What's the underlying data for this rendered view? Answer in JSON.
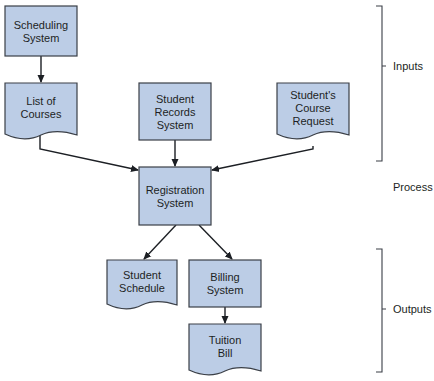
{
  "diagram": {
    "type": "system-flowchart",
    "colors": {
      "box_fill": "#bccde6",
      "box_stroke": "#3a3f47",
      "text": "#1c1f24"
    },
    "nodes": [
      {
        "id": "scheduling",
        "shape": "process",
        "lines": [
          "Scheduling",
          "System"
        ]
      },
      {
        "id": "courses",
        "shape": "document",
        "lines": [
          "List of",
          "Courses"
        ]
      },
      {
        "id": "records",
        "shape": "process",
        "lines": [
          "Student",
          "Records",
          "System"
        ]
      },
      {
        "id": "request",
        "shape": "document",
        "lines": [
          "Student's",
          "Course",
          "Request"
        ]
      },
      {
        "id": "registration",
        "shape": "process",
        "lines": [
          "Registration",
          "System"
        ]
      },
      {
        "id": "schedule",
        "shape": "document",
        "lines": [
          "Student",
          "Schedule"
        ]
      },
      {
        "id": "billing",
        "shape": "process",
        "lines": [
          "Billing",
          "System"
        ]
      },
      {
        "id": "tuition",
        "shape": "document",
        "lines": [
          "Tuition",
          "Bill"
        ]
      }
    ],
    "edges": [
      {
        "from": "scheduling",
        "to": "courses"
      },
      {
        "from": "courses",
        "to": "registration"
      },
      {
        "from": "records",
        "to": "registration"
      },
      {
        "from": "request",
        "to": "registration"
      },
      {
        "from": "registration",
        "to": "schedule"
      },
      {
        "from": "registration",
        "to": "billing"
      },
      {
        "from": "billing",
        "to": "tuition"
      }
    ],
    "sections": [
      {
        "id": "inputs",
        "label": "Inputs",
        "bracket": true
      },
      {
        "id": "process",
        "label": "Process",
        "bracket": false
      },
      {
        "id": "outputs",
        "label": "Outputs",
        "bracket": true
      }
    ]
  }
}
